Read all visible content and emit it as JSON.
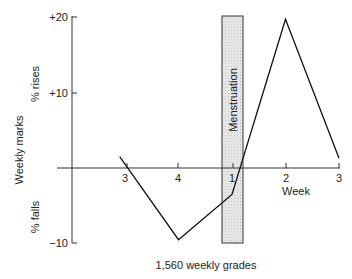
{
  "chart_data": {
    "type": "line",
    "title": "",
    "caption": "1,560 weekly grades",
    "xlabel": "Week",
    "ylabel": "Weekly marks",
    "ylabel_upper": "% rises",
    "ylabel_lower": "% falls",
    "ylim": [
      -10,
      20
    ],
    "yticks": [
      20,
      10,
      -10
    ],
    "ytick_labels": [
      "+20",
      "+10",
      "−10"
    ],
    "x_categories": [
      "3",
      "4",
      "1",
      "2",
      "3"
    ],
    "x": [
      -0.1,
      1,
      2,
      3,
      4
    ],
    "values": [
      1.5,
      -9.5,
      -3.5,
      19.7,
      1.3
    ],
    "annotation": {
      "label": "Menstruation",
      "type": "shaded-band",
      "x_start": 1.8,
      "x_end": 2.2,
      "y_range": [
        -10,
        20
      ]
    },
    "grid": false,
    "legend": null
  },
  "colors": {
    "line": "#111111",
    "axis": "#333333",
    "band_fill": "#e4e4e4",
    "band_stroke": "#333333"
  }
}
